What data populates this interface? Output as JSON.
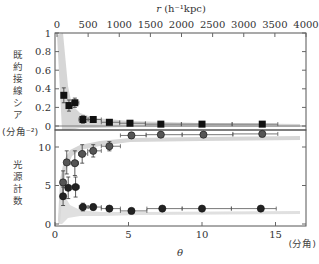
{
  "chart_data": [
    {
      "type": "scatter",
      "panel": "upper",
      "title": "",
      "top_xlabel": "r (h^-1 kpc)",
      "top_xlabel_parts": {
        "var": "r",
        "unit": "(h⁻¹kpc)"
      },
      "top_xticks": [
        "0",
        "500",
        "1000",
        "1500",
        "2000",
        "2500",
        "3000",
        "3500",
        "4000"
      ],
      "top_xlim": [
        0,
        4000
      ],
      "ylabel": "既約接線シア",
      "ylabel_chars": [
        "既",
        "約",
        "接",
        "線",
        "シ",
        "ア"
      ],
      "yticks": [
        "0",
        "0.2",
        "0.4",
        "0.6",
        "0.8",
        "1"
      ],
      "ylim": [
        0,
        1
      ],
      "grid": false,
      "series": [
        {
          "name": "tangential shear",
          "marker": "square",
          "color": "#111111",
          "x_theta": [
            0.6,
            0.95,
            1.35,
            1.9,
            2.6,
            3.7,
            5.1,
            7.2,
            10.0,
            14.1
          ],
          "r": [
            110,
            190,
            290,
            420,
            600,
            840,
            1180,
            1680,
            2330,
            3310
          ],
          "y": [
            0.33,
            0.22,
            0.25,
            0.07,
            0.07,
            0.04,
            0.03,
            0.02,
            0.02,
            0.02
          ],
          "yerr": [
            0.08,
            0.06,
            0.05,
            0.04,
            0.03,
            0.02,
            0.02,
            0.015,
            0.015,
            0.015
          ]
        }
      ],
      "model_band": {
        "color": "#c8c8c8",
        "description": "gray model band"
      }
    },
    {
      "type": "scatter",
      "panel": "lower",
      "xlabel": "θ",
      "xunit": "(分角)",
      "xticks": [
        "0",
        "5",
        "10",
        "15"
      ],
      "xlim": [
        0,
        17
      ],
      "ylabel": "光源計数",
      "ylabel_chars": [
        "光",
        "源",
        "計",
        "数"
      ],
      "yunit": "(分角⁻²)",
      "yticks": [
        "0",
        "5",
        "10"
      ],
      "ylim": [
        0,
        12.5
      ],
      "grid": false,
      "series": [
        {
          "name": "red background counts",
          "marker": "circle",
          "color": "#555555",
          "x": [
            0.55,
            0.8,
            1.35,
            1.85,
            2.6,
            3.7,
            5.2,
            7.2,
            10.1,
            14.1
          ],
          "y": [
            5.4,
            8.0,
            7.9,
            9.1,
            9.5,
            10.1,
            11.5,
            11.6,
            11.6,
            11.7
          ],
          "yerr": [
            1.5,
            1.5,
            1.6,
            1.2,
            0.8,
            0.6,
            0.4,
            0.3,
            0.3,
            0.3
          ]
        },
        {
          "name": "blue background counts",
          "marker": "circle",
          "color": "#222222",
          "x": [
            0.55,
            0.9,
            1.4,
            1.9,
            2.6,
            3.7,
            5.2,
            7.3,
            10.0,
            14.0
          ],
          "y": [
            3.6,
            4.7,
            4.8,
            2.2,
            2.2,
            2.0,
            1.7,
            2.0,
            2.0,
            2.0
          ],
          "yerr": [
            1.2,
            1.4,
            1.3,
            0.5,
            0.4,
            0.3,
            0.3,
            0.2,
            0.2,
            0.2
          ]
        }
      ]
    }
  ],
  "labels": {
    "top_axis_title": "r",
    "top_axis_unit": "(h⁻¹kpc)",
    "upper_ylabel": [
      "既",
      "約",
      "接",
      "線",
      "シ",
      "ア"
    ],
    "lower_ylabel": [
      "光",
      "源",
      "計",
      "数"
    ],
    "lower_yunit": "(分角⁻²)",
    "xunit": "(分角)",
    "xlabel": "θ"
  }
}
